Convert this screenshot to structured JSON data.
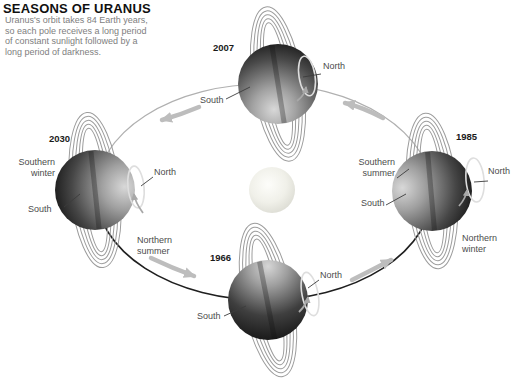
{
  "header": {
    "title": "SEASONS OF URANUS",
    "description": "Uranus's orbit takes 84 Earth years,\nso each pole receives a long period\nof constant sunlight followed by a\nlong period of darkness."
  },
  "sun": {
    "name": "sun"
  },
  "planets": {
    "p2007": {
      "year": "2007",
      "north": "North",
      "south": "South"
    },
    "p1985": {
      "year": "1985",
      "north": "North",
      "south": "South",
      "season_outer": "Southern\nsummer",
      "season_inner": "Northern\nwinter"
    },
    "p1966": {
      "year": "1966",
      "north": "North",
      "south": "South"
    },
    "p2030": {
      "year": "2030",
      "north": "North",
      "south": "South",
      "season_outer": "Southern\nwinter",
      "season_inner": "Northern\nsummer"
    }
  },
  "colors": {
    "orbit_light": "#b0b0b0",
    "orbit_dark": "#1f1f1f",
    "arrow": "#bdbdbd",
    "ring": "#9c9c9c",
    "planet_light": "#d8d8d8",
    "planet_dark": "#141414",
    "sun_core": "#fdfdfa",
    "sun_edge": "#d8d8cf"
  }
}
